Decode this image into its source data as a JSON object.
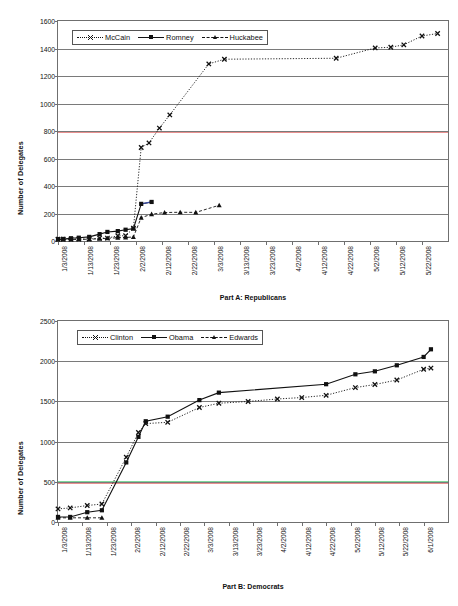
{
  "figure": {
    "background": "#ffffff",
    "axis_color": "#6f6f6f",
    "grid_color": "#7a7a7a"
  },
  "chart_data": [
    {
      "id": "part-a",
      "type": "line",
      "title": "Part A: Republicans",
      "xlabel": "Part A: Republicans",
      "ylabel": "Number of Delegates",
      "ylim": [
        0,
        1600
      ],
      "ytick_step": 200,
      "yticks": [
        "0",
        "200",
        "400",
        "600",
        "800",
        "1000",
        "1200",
        "1400",
        "1600"
      ],
      "grid": true,
      "legend_position": "top-left-inside",
      "xlim_days": [
        0,
        150
      ],
      "xticks": [
        "1/3/2008",
        "1/13/2008",
        "1/23/2008",
        "2/2/2008",
        "2/12/2008",
        "2/22/2008",
        "3/3/2008",
        "3/13/2008",
        "3/23/2008",
        "4/2/2008",
        "4/12/2008",
        "4/22/2008",
        "5/2/2008",
        "5/12/2008",
        "5/22/2008"
      ],
      "xtick_days": [
        0,
        10,
        20,
        30,
        40,
        50,
        60,
        70,
        80,
        90,
        100,
        110,
        120,
        130,
        140
      ],
      "reference_lines": [
        {
          "name": "republican-nomination-threshold",
          "value": 790,
          "color": "#e8908f"
        }
      ],
      "series": [
        {
          "name": "McCain",
          "color": "#111111",
          "line_style": "dotted",
          "marker": "x",
          "points": [
            {
              "x": 0,
              "y": 13
            },
            {
              "x": 2,
              "y": 13
            },
            {
              "x": 5,
              "y": 13
            },
            {
              "x": 8,
              "y": 14
            },
            {
              "x": 12,
              "y": 14
            },
            {
              "x": 16,
              "y": 21
            },
            {
              "x": 19,
              "y": 21
            },
            {
              "x": 23,
              "y": 38
            },
            {
              "x": 26,
              "y": 38
            },
            {
              "x": 29,
              "y": 93
            },
            {
              "x": 32,
              "y": 680
            },
            {
              "x": 35,
              "y": 713
            },
            {
              "x": 39,
              "y": 821
            },
            {
              "x": 43,
              "y": 917
            },
            {
              "x": 58,
              "y": 1288
            },
            {
              "x": 64,
              "y": 1322
            },
            {
              "x": 107,
              "y": 1329
            },
            {
              "x": 122,
              "y": 1404
            },
            {
              "x": 128,
              "y": 1409
            },
            {
              "x": 133,
              "y": 1427
            },
            {
              "x": 140,
              "y": 1491
            },
            {
              "x": 146,
              "y": 1509
            }
          ]
        },
        {
          "name": "Romney",
          "color": "#111111",
          "accent_color": "#3b4ea8",
          "line_style": "solid",
          "marker": "square",
          "points": [
            {
              "x": 0,
              "y": 14
            },
            {
              "x": 2,
              "y": 15
            },
            {
              "x": 5,
              "y": 20
            },
            {
              "x": 8,
              "y": 24
            },
            {
              "x": 12,
              "y": 30
            },
            {
              "x": 16,
              "y": 50
            },
            {
              "x": 19,
              "y": 66
            },
            {
              "x": 23,
              "y": 72
            },
            {
              "x": 26,
              "y": 82
            },
            {
              "x": 29,
              "y": 90
            },
            {
              "x": 32,
              "y": 270
            },
            {
              "x": 36,
              "y": 284
            }
          ]
        },
        {
          "name": "Huckabee",
          "color": "#111111",
          "line_style": "dashed",
          "marker": "triangle",
          "points": [
            {
              "x": 0,
              "y": 11
            },
            {
              "x": 2,
              "y": 11
            },
            {
              "x": 5,
              "y": 11
            },
            {
              "x": 8,
              "y": 12
            },
            {
              "x": 12,
              "y": 13
            },
            {
              "x": 16,
              "y": 16
            },
            {
              "x": 19,
              "y": 20
            },
            {
              "x": 23,
              "y": 23
            },
            {
              "x": 26,
              "y": 26
            },
            {
              "x": 29,
              "y": 29
            },
            {
              "x": 32,
              "y": 170
            },
            {
              "x": 36,
              "y": 195
            },
            {
              "x": 41,
              "y": 207
            },
            {
              "x": 47,
              "y": 209
            },
            {
              "x": 53,
              "y": 208
            },
            {
              "x": 62,
              "y": 260
            }
          ]
        }
      ]
    },
    {
      "id": "part-b",
      "type": "line",
      "title": "Part B: Democrats",
      "xlabel": "Part B: Democrats",
      "ylabel": "Number of Delegates",
      "ylim": [
        0,
        2500
      ],
      "ytick_step": 500,
      "yticks": [
        "0",
        "500",
        "1000",
        "1500",
        "2000",
        "2500"
      ],
      "grid": true,
      "legend_position": "top-left-inside",
      "xlim_days": [
        0,
        160
      ],
      "xticks": [
        "1/3/2008",
        "1/13/2008",
        "1/23/2008",
        "2/2/2008",
        "2/12/2008",
        "2/22/2008",
        "3/3/2008",
        "3/13/2008",
        "3/23/2008",
        "4/2/2008",
        "4/12/2008",
        "4/22/2008",
        "5/2/2008",
        "5/12/2008",
        "5/22/2008",
        "6/1/2008"
      ],
      "xtick_days": [
        0,
        10,
        20,
        30,
        40,
        50,
        60,
        70,
        80,
        90,
        100,
        110,
        120,
        130,
        140,
        150
      ],
      "reference_lines": [
        {
          "name": "pledged-delegate-marker",
          "value": 505,
          "color": "#7fd79a"
        },
        {
          "name": "democratic-threshold-marker",
          "value": 480,
          "color": "#e8908f"
        }
      ],
      "series": [
        {
          "name": "Clinton",
          "color": "#111111",
          "line_style": "dotted",
          "marker": "x",
          "points": [
            {
              "x": 0,
              "y": 163
            },
            {
              "x": 5,
              "y": 175
            },
            {
              "x": 12,
              "y": 205
            },
            {
              "x": 18,
              "y": 224
            },
            {
              "x": 28,
              "y": 806
            },
            {
              "x": 33,
              "y": 1113
            },
            {
              "x": 36,
              "y": 1224
            },
            {
              "x": 45,
              "y": 1240
            },
            {
              "x": 58,
              "y": 1424
            },
            {
              "x": 66,
              "y": 1477
            },
            {
              "x": 78,
              "y": 1499
            },
            {
              "x": 90,
              "y": 1530
            },
            {
              "x": 100,
              "y": 1548
            },
            {
              "x": 110,
              "y": 1576
            },
            {
              "x": 122,
              "y": 1672
            },
            {
              "x": 130,
              "y": 1710
            },
            {
              "x": 139,
              "y": 1766
            },
            {
              "x": 150,
              "y": 1900
            },
            {
              "x": 153,
              "y": 1914
            }
          ]
        },
        {
          "name": "Obama",
          "color": "#111111",
          "line_style": "solid",
          "marker": "square",
          "points": [
            {
              "x": 0,
              "y": 63
            },
            {
              "x": 5,
              "y": 63
            },
            {
              "x": 12,
              "y": 122
            },
            {
              "x": 18,
              "y": 146
            },
            {
              "x": 28,
              "y": 741
            },
            {
              "x": 33,
              "y": 1059
            },
            {
              "x": 36,
              "y": 1253
            },
            {
              "x": 45,
              "y": 1310
            },
            {
              "x": 58,
              "y": 1516
            },
            {
              "x": 66,
              "y": 1609
            },
            {
              "x": 110,
              "y": 1714
            },
            {
              "x": 122,
              "y": 1837
            },
            {
              "x": 130,
              "y": 1874
            },
            {
              "x": 139,
              "y": 1949
            },
            {
              "x": 150,
              "y": 2053
            },
            {
              "x": 153,
              "y": 2148
            }
          ]
        },
        {
          "name": "Edwards",
          "color": "#111111",
          "line_style": "dashed",
          "marker": "triangle",
          "points": [
            {
              "x": 0,
              "y": 52
            },
            {
              "x": 5,
              "y": 52
            },
            {
              "x": 12,
              "y": 52
            },
            {
              "x": 18,
              "y": 52
            }
          ]
        }
      ]
    }
  ]
}
